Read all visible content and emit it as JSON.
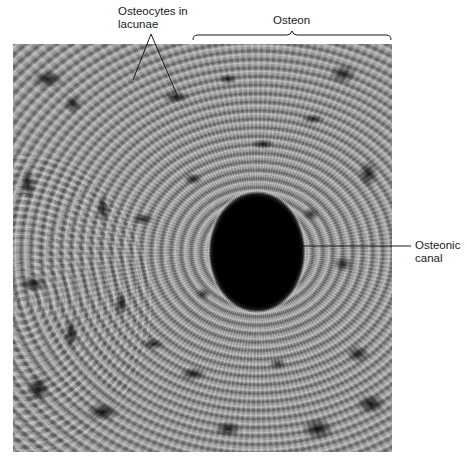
{
  "figure": {
    "type": "histology-micrograph",
    "labels": {
      "osteocytes": {
        "line1": "Osteocytes in",
        "line2": "lacunae"
      },
      "osteon": "Osteon",
      "canal": {
        "line1": "Osteonic",
        "line2": "canal"
      }
    },
    "colors": {
      "label_text": "#1a1a1a",
      "leader_line": "#1a1a1a",
      "background": "#ffffff",
      "canal": "#050505"
    }
  }
}
